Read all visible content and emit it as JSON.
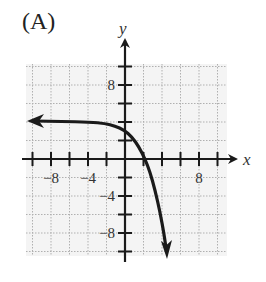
{
  "panel_label": "(A)",
  "chart_data": {
    "type": "line",
    "title": "(A)",
    "xlabel": "x",
    "ylabel": "y",
    "xlim": [
      -10.5,
      11.5
    ],
    "ylim": [
      -11.5,
      10.5
    ],
    "grid": true,
    "grid_step": 2,
    "x_tick_labels": [
      {
        "value": -8,
        "label": "−8"
      },
      {
        "value": -4,
        "label": "−4"
      },
      {
        "value": 8,
        "label": "8"
      }
    ],
    "y_tick_labels": [
      {
        "value": 8,
        "label": "8"
      },
      {
        "value": -4,
        "label": "−4"
      },
      {
        "value": -8,
        "label": "−8"
      }
    ],
    "series": [
      {
        "name": "curve",
        "description": "Decreasing exponential-type curve: horizontal asymptote y≈2 as x→−∞, y-intercept ≈1.8, x-intercept ≈2, falls steeply downward (arrow) as x increases",
        "points": [
          {
            "x": -10.3,
            "y": 2.05
          },
          {
            "x": -8,
            "y": 2.0
          },
          {
            "x": -4,
            "y": 2.0
          },
          {
            "x": -2.7,
            "y": 1.95
          },
          {
            "x": -1.1,
            "y": 1.6
          },
          {
            "x": 0,
            "y": 1.65
          },
          {
            "x": 1.1,
            "y": 2.05
          },
          {
            "x": 2.1,
            "y": 0
          },
          {
            "x": 2.9,
            "y": -2.8
          },
          {
            "x": 3.8,
            "y": -6.6
          },
          {
            "x": 4.5,
            "y": -10.4
          }
        ],
        "arrows": [
          "left",
          "down"
        ]
      }
    ],
    "color": "#1a1a1a"
  },
  "axes": {
    "x_name": "x",
    "y_name": "y"
  }
}
